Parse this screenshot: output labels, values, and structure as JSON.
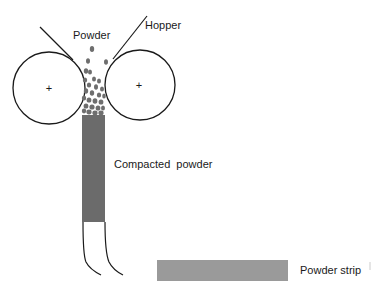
{
  "diagram": {
    "type": "powder-roll-compaction-schematic",
    "labels": {
      "powder": "Powder",
      "hopper": "Hopper",
      "compacted_powder": "Compacted  powder",
      "powder_strip": "Powder strip"
    },
    "rollers": [
      {
        "name": "left-roller",
        "cx": 49,
        "cy": 88,
        "r": 36,
        "center_mark": "+"
      },
      {
        "name": "right-roller",
        "cx": 140,
        "cy": 85,
        "r": 35,
        "center_mark": "+"
      }
    ],
    "colors": {
      "stroke": "#1a1a1a",
      "compacted": "#6b6b6b",
      "particles": "#6e6e6e",
      "strip": "#9a9a9a",
      "background": "#ffffff"
    }
  }
}
